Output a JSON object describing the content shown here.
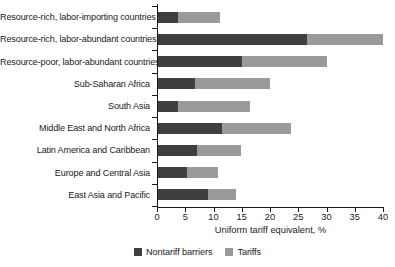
{
  "chart_data": {
    "type": "bar",
    "orientation": "horizontal",
    "stacked": true,
    "title": "",
    "xlabel": "Uniform tariff equivalent, %",
    "ylabel": "",
    "xlim": [
      0,
      40
    ],
    "xticks": [
      "0",
      "5",
      "10",
      "15",
      "20",
      "25",
      "30",
      "35",
      "40"
    ],
    "grid": false,
    "legend_position": "bottom-center",
    "categories": [
      "Resource-rich, labor-importing countries",
      "Resource-rich, labor-abundant countries",
      "Resource-poor, labor-abundant countries",
      "Sub-Saharan Africa",
      "South Asia",
      "Middle East and North Africa",
      "Latin America and Caribbean",
      "Europe and Central Asia",
      "East Asia and Pacific"
    ],
    "series": [
      {
        "name": "Nontariff barriers",
        "color": "#3f3f3f",
        "values": [
          3.7,
          26.5,
          15.0,
          6.7,
          3.7,
          11.5,
          7.0,
          5.3,
          9.0
        ]
      },
      {
        "name": "Tariffs",
        "color": "#9a9a9a",
        "values": [
          7.4,
          13.5,
          15.0,
          13.3,
          12.8,
          12.3,
          7.8,
          5.5,
          5.0
        ]
      }
    ],
    "totals": [
      11.1,
      40.0,
      30.0,
      20.0,
      16.5,
      23.8,
      14.8,
      10.8,
      14.0
    ]
  },
  "legend": {
    "items": [
      {
        "label": "Nontariff barriers",
        "color": "#3f3f3f"
      },
      {
        "label": "Tariffs",
        "color": "#9a9a9a"
      }
    ]
  }
}
